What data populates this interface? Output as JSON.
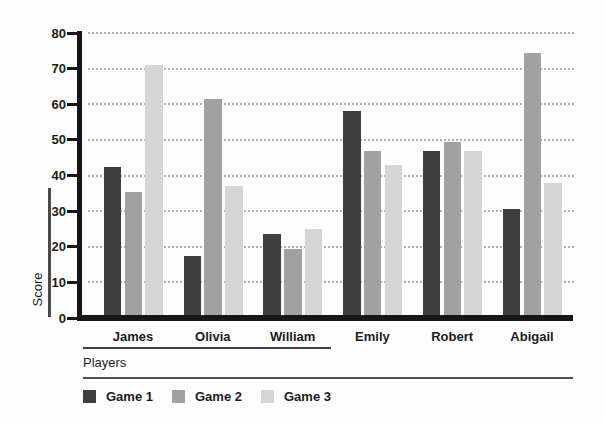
{
  "chart_data": {
    "type": "bar",
    "title": "",
    "xlabel": "Players",
    "ylabel": "Score",
    "categories": [
      "James",
      "Olivia",
      "William",
      "Emily",
      "Robert",
      "Abigail"
    ],
    "series": [
      {
        "name": "Game 1",
        "color": "#3e3e3e",
        "values": [
          42.5,
          17.5,
          23.5,
          58,
          47,
          30.5
        ]
      },
      {
        "name": "Game 2",
        "color": "#a1a1a1",
        "values": [
          35.5,
          61.5,
          19.5,
          47,
          49.5,
          74.5
        ]
      },
      {
        "name": "Game 3",
        "color": "#d5d5d5",
        "values": [
          71,
          37,
          25,
          43,
          47,
          38
        ]
      }
    ],
    "ylim": [
      0,
      80
    ],
    "yticks": [
      0,
      10,
      20,
      30,
      40,
      50,
      60,
      70,
      80
    ],
    "grid": "horizontal-dotted",
    "legend_position": "bottom",
    "colors": {
      "axis": "#161616",
      "gridline": "#b0b0b0",
      "text": "#1c1c1c",
      "bracket": "#4a4a4a"
    }
  }
}
